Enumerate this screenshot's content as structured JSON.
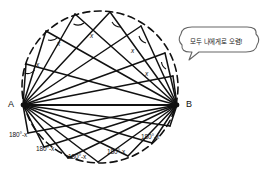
{
  "figure": {
    "background_color": "#ffffff",
    "stroke_color": "#111111",
    "circle": {
      "center_x": 100,
      "center_y": 87,
      "radius_x": 78,
      "radius_y": 76,
      "style": "dashed"
    },
    "endpoints": {
      "a_label": "A",
      "b_label": "B",
      "a_x": 23,
      "a_y": 105,
      "b_x": 177,
      "b_y": 105
    }
  },
  "upper_angles": {
    "label": "x",
    "items": [
      {
        "text": "x",
        "x": 36,
        "y": 61
      },
      {
        "text": "x",
        "x": 57,
        "y": 40
      },
      {
        "text": "x",
        "x": 90,
        "y": 32
      },
      {
        "text": "x",
        "x": 131,
        "y": 47
      },
      {
        "text": "x",
        "x": 145,
        "y": 70
      }
    ]
  },
  "lower_angles": {
    "label": "180°-x",
    "items": [
      {
        "text": "180°-x",
        "x": 9,
        "y": 131
      },
      {
        "text": "180°-x",
        "x": 36,
        "y": 145
      },
      {
        "text": "180°-x",
        "x": 68,
        "y": 153
      },
      {
        "text": "180°-x",
        "x": 107,
        "y": 148
      },
      {
        "text": "180°-x",
        "x": 141,
        "y": 133
      }
    ]
  },
  "speech_bubble": {
    "text": "모두 나에게로 오렴!",
    "x": 180,
    "y": 27,
    "width": 78,
    "height": 26,
    "tail_x": 193,
    "tail_y": 53,
    "border_color": "#555555",
    "fill_color": "#ffffff"
  },
  "geometry": {
    "upper_points": [
      {
        "x": 26,
        "y": 64
      },
      {
        "x": 46,
        "y": 31
      },
      {
        "x": 75,
        "y": 14
      },
      {
        "x": 110,
        "y": 12
      },
      {
        "x": 141,
        "y": 26
      },
      {
        "x": 165,
        "y": 53
      },
      {
        "x": 173,
        "y": 76
      }
    ],
    "lower_points": [
      {
        "x": 28,
        "y": 133
      },
      {
        "x": 44,
        "y": 147
      },
      {
        "x": 68,
        "y": 158
      },
      {
        "x": 98,
        "y": 162
      },
      {
        "x": 128,
        "y": 156
      },
      {
        "x": 152,
        "y": 143
      },
      {
        "x": 170,
        "y": 126
      }
    ]
  }
}
